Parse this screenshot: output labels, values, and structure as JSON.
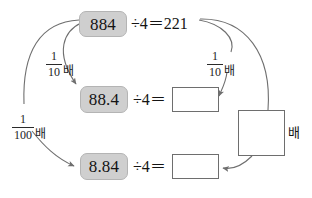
{
  "diagram": {
    "colors": {
      "chip_fill": "#cfcfcf",
      "chip_border": "#b4b4b4",
      "box_border": "#6e6e6e",
      "arrow": "#6f6f6f",
      "text": "#141414",
      "background": "#ffffff"
    },
    "rows": [
      {
        "id": "row-1",
        "dividend": "884",
        "equation": "÷4＝221",
        "quotient": "221",
        "answer_box_value": ""
      },
      {
        "id": "row-2",
        "dividend": "88.4",
        "equation": "÷4＝",
        "quotient": "",
        "answer_box_value": ""
      },
      {
        "id": "row-3",
        "dividend": "8.84",
        "equation": "÷4＝",
        "quotient": "",
        "answer_box_value": ""
      }
    ],
    "multipliers": [
      {
        "id": "left-tenth",
        "numerator": "1",
        "denominator": "10",
        "unit": "배",
        "from": "884",
        "to": "88.4"
      },
      {
        "id": "right-tenth",
        "numerator": "1",
        "denominator": "10",
        "unit": "배",
        "from": "221",
        "to": "row-2 answer box"
      },
      {
        "id": "left-hundredth",
        "numerator": "1",
        "denominator": "100",
        "unit": "배",
        "from": "884",
        "to": "8.84"
      }
    ],
    "unknown_multiplier": {
      "id": "right-square",
      "value": "",
      "unit": "배",
      "from": "221",
      "to": "row-3 answer box"
    }
  }
}
